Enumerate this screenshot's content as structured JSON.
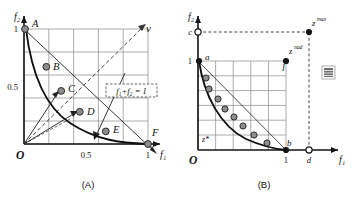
{
  "figure": {
    "panels": [
      {
        "id": "A",
        "caption": "(A)",
        "axes": {
          "x_label": "f₁",
          "y_label": "f₂",
          "origin_label": "O",
          "x_ticks": [
            {
              "value": 0.5,
              "label": "0.5"
            },
            {
              "value": 1.0,
              "label": "1"
            }
          ],
          "y_ticks": [
            {
              "value": 0.5,
              "label": "0.5"
            },
            {
              "value": 1.0,
              "label": "1"
            }
          ],
          "xlim": [
            0,
            1.25
          ],
          "ylim": [
            0,
            1.25
          ],
          "grid": true
        },
        "annotations": [
          {
            "name": "direction-vector-label",
            "text": "v",
            "x": 1.2,
            "y": 1.15
          },
          {
            "name": "constraint-line-label",
            "text": "f₁+f₂ = 1",
            "x": 0.86,
            "y": 0.6,
            "boxed": true,
            "box_style": "dashed"
          }
        ],
        "points": [
          {
            "label": "A",
            "f1": 0.0,
            "f2": 1.0
          },
          {
            "label": "B",
            "f1": 0.18,
            "f2": 0.68
          },
          {
            "label": "C",
            "f1": 0.3,
            "f2": 0.47
          },
          {
            "label": "D",
            "f1": 0.45,
            "f2": 0.28
          },
          {
            "label": "E",
            "f1": 0.66,
            "f2": 0.11
          },
          {
            "label": "F",
            "f1": 1.0,
            "f2": 0.0
          }
        ],
        "pareto_front": {
          "type": "convex-decreasing",
          "from": [
            0,
            1
          ],
          "to": [
            1,
            0
          ]
        },
        "rays": [
          {
            "name": "ray-to-C",
            "from": [
              0,
              0
            ],
            "to": [
              0.3,
              0.47
            ],
            "style": "solid-arrow"
          },
          {
            "name": "ray-to-D",
            "from": [
              0,
              0
            ],
            "to": [
              0.45,
              0.28
            ],
            "style": "solid-arrow"
          },
          {
            "name": "ray-diagonal",
            "from": [
              0,
              0
            ],
            "to": [
              1.2,
              1.15
            ],
            "style": "dashed-arrow"
          },
          {
            "name": "ray-dashed-lower",
            "from": [
              0,
              0
            ],
            "to": [
              0.4,
              0.22
            ],
            "style": "dashed"
          }
        ],
        "lines": [
          {
            "name": "sum-constraint-line",
            "from": [
              0,
              1
            ],
            "to": [
              1.15,
              -0.07
            ],
            "style": "solid-thin-arrow"
          },
          {
            "name": "normal-arrow",
            "from": [
              1.02,
              0.62
            ],
            "to": [
              0.62,
              0.08
            ],
            "style": "solid-thin-arrow"
          }
        ]
      },
      {
        "id": "B",
        "caption": "(B)",
        "axes": {
          "x_label": "f₁",
          "y_label": "f₂",
          "origin_label": "O",
          "x_ticks": [
            {
              "value": 1.0,
              "label": "1"
            },
            {
              "value": 1.55,
              "label": "d"
            }
          ],
          "y_ticks": [
            {
              "value": 1.0,
              "label": "1"
            },
            {
              "value": 1.45,
              "label": "c"
            }
          ],
          "xlim": [
            0,
            1.9
          ],
          "ylim": [
            0,
            1.65
          ],
          "grid": true
        },
        "annotations": [
          {
            "name": "ideal-point-label",
            "text": "z*",
            "x": 0.1,
            "y": 0.12
          },
          {
            "name": "nadir-point-label",
            "text": "z",
            "sup": "nad",
            "x": 1.06,
            "y": 1.06
          },
          {
            "name": "max-point-label",
            "text": "z",
            "sup": "max",
            "x": 1.6,
            "y": 1.5
          },
          {
            "name": "point-a-label",
            "text": "a",
            "x": 0.08,
            "y": 0.96
          },
          {
            "name": "point-b-label",
            "text": "b",
            "x": 0.94,
            "y": 0.08
          },
          {
            "name": "point-l-label",
            "text": "l",
            "x": 0.97,
            "y": 0.93
          }
        ],
        "points": [
          {
            "name": "point-a",
            "f1": 0.0,
            "f2": 1.0,
            "fill": "solid"
          },
          {
            "name": "point-b",
            "f1": 1.0,
            "f2": 0.0,
            "fill": "solid"
          },
          {
            "name": "point-l",
            "f1": 1.0,
            "f2": 1.0,
            "fill": "solid"
          },
          {
            "name": "point-zmax",
            "f1": 1.55,
            "f2": 1.45,
            "fill": "solid"
          },
          {
            "name": "point-c",
            "f1": 0.0,
            "f2": 1.45,
            "fill": "hollow"
          },
          {
            "name": "point-d",
            "f1": 1.55,
            "f2": 0.0,
            "fill": "hollow"
          }
        ],
        "sample_points": [
          {
            "f1": 0.09,
            "f2": 0.8
          },
          {
            "f1": 0.12,
            "f2": 0.68
          },
          {
            "f1": 0.22,
            "f2": 0.57
          },
          {
            "f1": 0.31,
            "f2": 0.46
          },
          {
            "f1": 0.41,
            "f2": 0.37
          },
          {
            "f1": 0.5,
            "f2": 0.27
          },
          {
            "f1": 0.63,
            "f2": 0.17
          },
          {
            "f1": 0.78,
            "f2": 0.09
          }
        ],
        "pareto_front": {
          "type": "convex-decreasing",
          "from": [
            0,
            1
          ],
          "to": [
            1,
            0
          ]
        },
        "lines": [
          {
            "name": "chord-ab",
            "from": [
              0,
              1
            ],
            "to": [
              1,
              0
            ],
            "style": "solid-thin"
          },
          {
            "name": "c-to-zmax-guide",
            "from": [
              0,
              1.45
            ],
            "to": [
              1.55,
              1.45
            ],
            "style": "dashed"
          },
          {
            "name": "d-to-zmax-guide",
            "from": [
              1.55,
              0
            ],
            "to": [
              1.55,
              1.45
            ],
            "style": "dashed"
          }
        ],
        "legend_marker": {
          "name": "hatched-square-marker",
          "x": 1.72,
          "y": 1.12
        }
      }
    ]
  },
  "colors": {
    "point_fill": "#8d8d8d",
    "point_stroke": "#2b2b2b",
    "grid": "#8a8a8a",
    "axis": "#141414",
    "curve": "#111111",
    "background": "#ffffff"
  }
}
